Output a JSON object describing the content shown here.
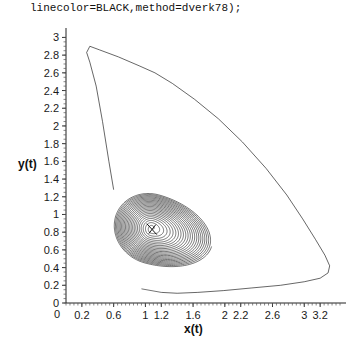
{
  "header": {
    "code_line": "linecolor=BLACK,method=dverk78);"
  },
  "axes": {
    "xlabel": "x(t)",
    "ylabel": "y(t)",
    "x_tick_labels": [
      "0.2",
      "0.6",
      "1",
      "1.2",
      "1.6",
      "2",
      "2.2",
      "2.6",
      "3",
      "3.2"
    ],
    "x_tick_values": [
      0.2,
      0.6,
      1,
      1.2,
      1.6,
      2,
      2.2,
      2.6,
      3,
      3.2
    ],
    "y_tick_labels": [
      "0",
      "0.2",
      "0.4",
      "0.6",
      "0.8",
      "1",
      "1.2",
      "1.4",
      "1.6",
      "1.8",
      "2",
      "2.2",
      "2.4",
      "2.6",
      "2.8",
      "3"
    ],
    "y_tick_values": [
      0,
      0.2,
      0.4,
      0.6,
      0.8,
      1,
      1.2,
      1.4,
      1.6,
      1.8,
      2,
      2.2,
      2.4,
      2.6,
      2.8,
      3
    ],
    "origin_label": "0"
  },
  "chart_data": {
    "type": "line",
    "title": "",
    "subtitle": "",
    "xlabel": "x(t)",
    "ylabel": "y(t)",
    "xlim": [
      0,
      3.45
    ],
    "ylim": [
      0,
      3.05
    ],
    "grid": false,
    "legend": "none",
    "line_color": "#000000",
    "focus_point": {
      "x": 1.08,
      "y": 0.84
    },
    "series": [
      {
        "name": "outer-orbit",
        "points": [
          [
            0.6,
            1.28
          ],
          [
            0.54,
            1.6
          ],
          [
            0.46,
            2.05
          ],
          [
            0.38,
            2.45
          ],
          [
            0.3,
            2.72
          ],
          [
            0.26,
            2.83
          ],
          [
            0.3,
            2.9
          ],
          [
            0.42,
            2.86
          ],
          [
            0.66,
            2.78
          ],
          [
            0.92,
            2.68
          ],
          [
            1.12,
            2.6
          ],
          [
            1.34,
            2.48
          ],
          [
            1.62,
            2.3
          ],
          [
            1.92,
            2.08
          ],
          [
            2.22,
            1.82
          ],
          [
            2.52,
            1.52
          ],
          [
            2.78,
            1.22
          ],
          [
            2.98,
            0.95
          ],
          [
            3.14,
            0.72
          ],
          [
            3.26,
            0.54
          ],
          [
            3.32,
            0.42
          ],
          [
            3.3,
            0.34
          ],
          [
            3.2,
            0.28
          ],
          [
            3.0,
            0.24
          ],
          [
            2.7,
            0.2
          ],
          [
            2.34,
            0.17
          ],
          [
            1.98,
            0.14
          ],
          [
            1.66,
            0.12
          ],
          [
            1.4,
            0.11
          ],
          [
            1.2,
            0.12
          ]
        ]
      },
      {
        "name": "inner-spiral",
        "turns": 23,
        "center": {
          "x": 1.08,
          "y": 0.84
        },
        "r_start": 0.02,
        "r_end_x": 0.78,
        "r_end_y": 0.4,
        "tilt_deg": -14
      }
    ]
  }
}
